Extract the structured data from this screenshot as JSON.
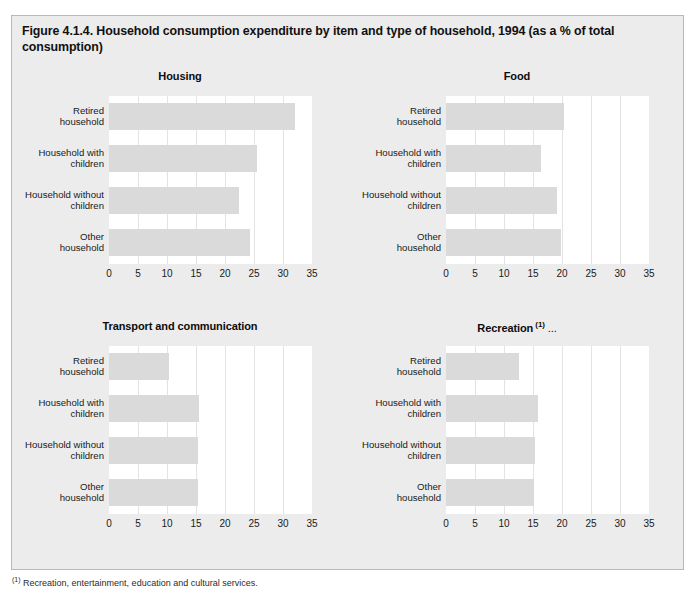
{
  "figure": {
    "title": "Figure 4.1.4. Household consumption expenditure by item and type of household, 1994 (as a % of total consumption)",
    "footnote_marker": "(1)",
    "footnote_text": "Recreation, entertainment, education and cultural services."
  },
  "chart_data": [
    {
      "type": "bar",
      "orientation": "horizontal",
      "title": "Housing",
      "title_sup": "",
      "title_trail": "",
      "categories": [
        "Retired household",
        "Household with children",
        "Household without children",
        "Other household"
      ],
      "values": [
        32.0,
        25.6,
        22.4,
        24.3
      ],
      "xlabel": "",
      "ylabel": "",
      "xlim": [
        0,
        35
      ],
      "xticks": [
        0,
        5,
        10,
        15,
        20,
        25,
        30,
        35
      ],
      "grid": true,
      "legend": "none",
      "bar_color": "#dadada",
      "plot_bg": "#ffffff"
    },
    {
      "type": "bar",
      "orientation": "horizontal",
      "title": "Food",
      "title_sup": "",
      "title_trail": "",
      "categories": [
        "Retired household",
        "Household with children",
        "Household without children",
        "Other household"
      ],
      "values": [
        20.3,
        16.3,
        19.2,
        19.8
      ],
      "xlabel": "",
      "ylabel": "",
      "xlim": [
        0,
        35
      ],
      "xticks": [
        0,
        5,
        10,
        15,
        20,
        25,
        30,
        35
      ],
      "grid": true,
      "legend": "none",
      "bar_color": "#dadada",
      "plot_bg": "#ffffff"
    },
    {
      "type": "bar",
      "orientation": "horizontal",
      "title": "Transport and communication",
      "title_sup": "",
      "title_trail": "",
      "categories": [
        "Retired household",
        "Household with children",
        "Household without children",
        "Other household"
      ],
      "values": [
        10.3,
        15.6,
        15.4,
        15.3
      ],
      "xlabel": "",
      "ylabel": "",
      "xlim": [
        0,
        35
      ],
      "xticks": [
        0,
        5,
        10,
        15,
        20,
        25,
        30,
        35
      ],
      "grid": true,
      "legend": "none",
      "bar_color": "#dadada",
      "plot_bg": "#ffffff"
    },
    {
      "type": "bar",
      "orientation": "horizontal",
      "title": "Recreation",
      "title_sup": "(1)",
      "title_trail": "...",
      "categories": [
        "Retired household",
        "Household with children",
        "Household without children",
        "Other household"
      ],
      "values": [
        12.6,
        15.9,
        15.4,
        15.1
      ],
      "xlabel": "",
      "ylabel": "",
      "xlim": [
        0,
        35
      ],
      "xticks": [
        0,
        5,
        10,
        15,
        20,
        25,
        30,
        35
      ],
      "grid": true,
      "legend": "none",
      "bar_color": "#dadada",
      "plot_bg": "#ffffff"
    }
  ]
}
